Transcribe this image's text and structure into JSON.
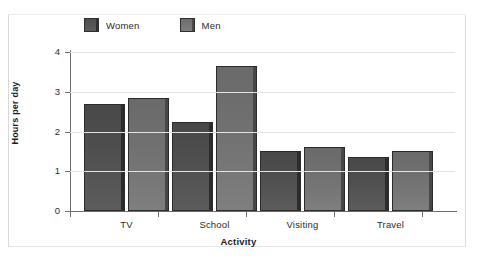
{
  "chart_data": {
    "type": "bar",
    "title": "",
    "xlabel": "Activity",
    "ylabel": "Hours per day",
    "categories": [
      "TV",
      "School",
      "Visiting",
      "Travel"
    ],
    "series": [
      {
        "name": "Women",
        "color": "#525252",
        "values": [
          2.7,
          2.25,
          1.5,
          1.35
        ]
      },
      {
        "name": "Men",
        "color": "#757575",
        "values": [
          2.85,
          3.65,
          1.62,
          1.5
        ]
      }
    ],
    "ylim": [
      0,
      4
    ],
    "yticks": [
      "0",
      "1",
      "2",
      "3",
      "4"
    ],
    "grid": true,
    "legend_position": "top-left"
  },
  "legend": {
    "entries": [
      {
        "label": "Women",
        "swatch": "women-swatch"
      },
      {
        "label": "Men",
        "swatch": "men-swatch"
      }
    ]
  },
  "axes": {
    "y_title": "Hours per day",
    "x_title": "Activity"
  }
}
